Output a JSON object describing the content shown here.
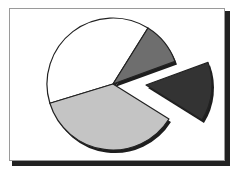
{
  "chart_data": {
    "type": "pie",
    "title": "",
    "legend": null,
    "labels_visible": false,
    "style": "3D-shadowed clip-art pie with one exploded slice",
    "center": [
      113,
      84
    ],
    "radius": 66,
    "slices": [
      {
        "name": "white",
        "value": 38.6,
        "start_deg": 163,
        "end_deg": 302,
        "fill": "#ffffff",
        "exploded": false
      },
      {
        "name": "mid-gray",
        "value": 10.6,
        "start_deg": 302,
        "end_deg": 340,
        "fill": "#6e6e6e",
        "exploded": false
      },
      {
        "name": "dark-gray",
        "value": 14.4,
        "start_deg": 340,
        "end_deg": 392,
        "fill": "#333333",
        "exploded": true,
        "offset": [
          33,
          1
        ]
      },
      {
        "name": "light-gray",
        "value": 36.4,
        "start_deg": 32,
        "end_deg": 163,
        "fill": "#c4c4c4",
        "exploded": false
      }
    ]
  },
  "colors": {
    "outline": "#222222",
    "shadow": "#1e1e1e",
    "frame_border": "#9a9a9a"
  }
}
